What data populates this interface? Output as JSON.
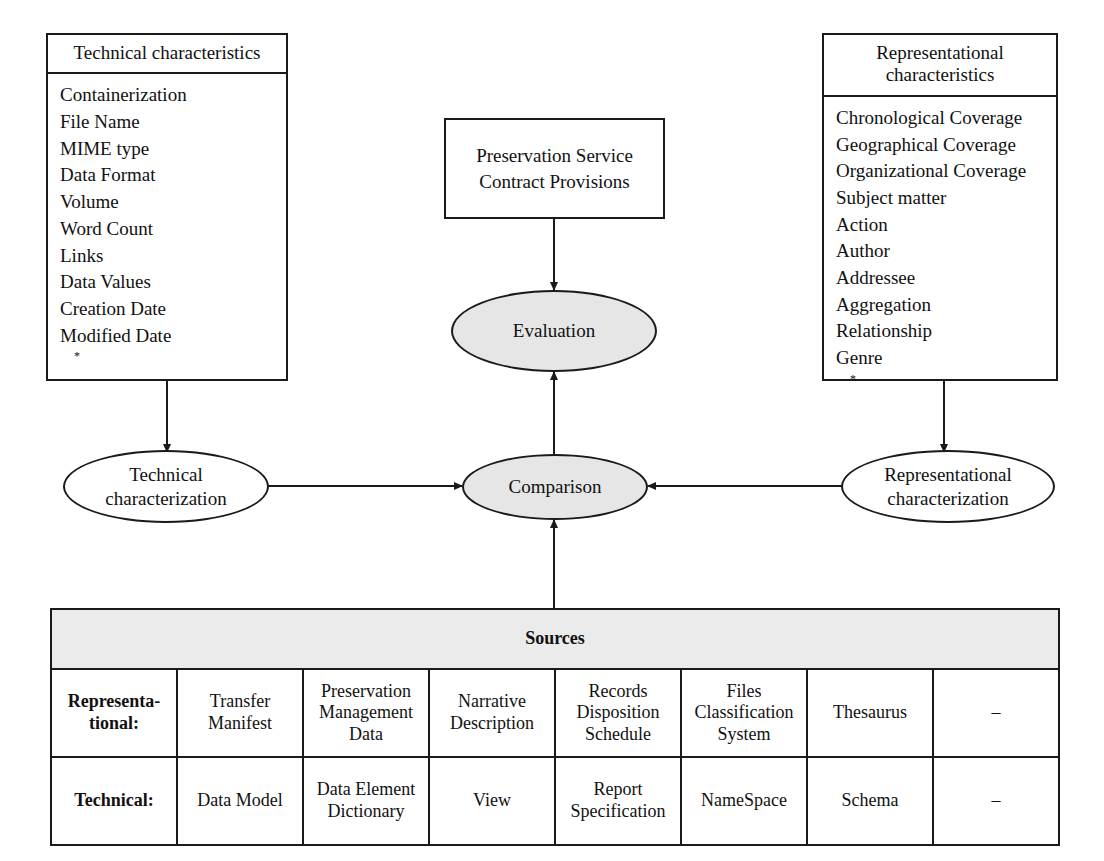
{
  "diagram": {
    "colors": {
      "line": "#1a1a1a",
      "shaded_fill": "#e6e6e6",
      "table_header_fill": "#ebebeb",
      "background": "#ffffff"
    }
  },
  "technical_box": {
    "header": "Technical characteristics",
    "items": [
      "Containerization",
      "File Name",
      "MIME type",
      "Data Format",
      "Volume",
      "Word Count",
      "Links",
      "Data Values",
      "Creation Date",
      "Modified Date"
    ],
    "continuation_marker": "*"
  },
  "representational_box": {
    "header_line1": "Representational",
    "header_line2": "characteristics",
    "items": [
      "Chronological Coverage",
      "Geographical Coverage",
      "Organizational Coverage",
      "Subject matter",
      "Action",
      "Author",
      "Addressee",
      "Aggregation",
      "Relationship",
      "Genre"
    ],
    "continuation_marker": "*"
  },
  "contract_box": {
    "line1": "Preservation Service",
    "line2": "Contract Provisions"
  },
  "ellipses": {
    "evaluation": {
      "label": "Evaluation",
      "shaded": "yes"
    },
    "comparison": {
      "label": "Comparison",
      "shaded": "yes"
    },
    "technical_characterization": {
      "line1": "Technical",
      "line2": "characterization",
      "shaded": "no"
    },
    "representational_characterization": {
      "line1": "Representational",
      "line2": "characterization",
      "shaded": "no"
    }
  },
  "sources_table": {
    "title": "Sources",
    "rows": [
      {
        "label_line1": "Representa-",
        "label_line2": "tional:",
        "cells": [
          "Transfer\nManifest",
          "Preservation\nManagement\nData",
          "Narrative\nDescription",
          "Records\nDisposition\nSchedule",
          "Files\nClassification\nSystem",
          "Thesaurus",
          "–"
        ]
      },
      {
        "label_line1": "Technical:",
        "label_line2": "",
        "cells": [
          "Data Model",
          "Data Element\nDictionary",
          "View",
          "Report\nSpecification",
          "NameSpace",
          "Schema",
          "–"
        ]
      }
    ]
  }
}
